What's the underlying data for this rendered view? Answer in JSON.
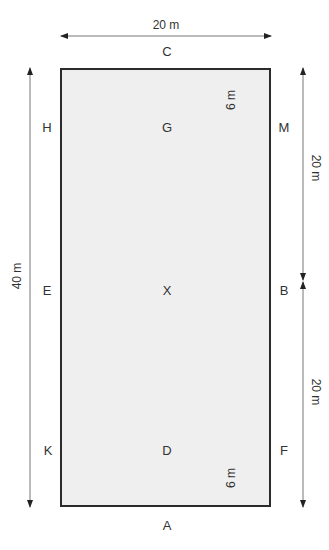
{
  "diagram": {
    "dimensions": {
      "width": "20 m",
      "length": "40 m",
      "half_length_upper": "20 m",
      "half_length_lower": "20 m",
      "marker_offset_top": "6 m",
      "marker_offset_bottom": "6 m"
    },
    "markers": {
      "C": "C",
      "H": "H",
      "G": "G",
      "M": "M",
      "E": "E",
      "X": "X",
      "B": "B",
      "K": "K",
      "D": "D",
      "F": "F",
      "A": "A"
    },
    "colors": {
      "arena_fill": "#efefef",
      "arena_border": "#2b2b2b",
      "arrow": "#333333"
    }
  }
}
